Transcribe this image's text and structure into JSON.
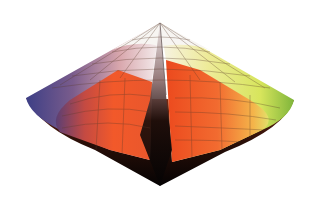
{
  "figure": {
    "apex_top": {
      "x": 160,
      "y": 23
    },
    "apex_bottom": {
      "x": 160,
      "y": 186
    },
    "equator_left": {
      "x": 26,
      "y": 98
    },
    "equator_right": {
      "x": 294,
      "y": 100
    },
    "colors": {
      "white": "#f7f5f2",
      "blue": "#3d3f86",
      "violet": "#6a4a78",
      "pink": "#d88a8a",
      "orange": "#f2592a",
      "orange_dark": "#c9401c",
      "yellow": "#e9ec7a",
      "lime": "#c5de4d",
      "green": "#7fb53b",
      "black": "#0d0707",
      "grid": "#5a3a2a"
    }
  }
}
